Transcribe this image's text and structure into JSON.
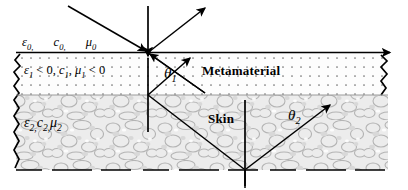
{
  "figure": {
    "type": "optics-ray-diagram",
    "width": 408,
    "height": 190
  },
  "layers": {
    "free_space": {
      "name": "free-space",
      "fill": "#ffffff",
      "params": {
        "epsilon": "ε",
        "epsilon_sub": "0,",
        "c": "c",
        "c_sub": "0,",
        "mu": "μ",
        "mu_sub": "0"
      }
    },
    "metamaterial": {
      "name": "Metamaterial",
      "fill": "#fdfdfd",
      "texture": "dotted",
      "top_y": 52,
      "bottom_y": 95,
      "params_text": "ε₁ < 0, c₁, μ₁ < 0",
      "params": {
        "epsilon": "ε",
        "epsilon_sub": "1",
        "epsilon_cond": " < 0,",
        "c": "c",
        "c_sub": "1",
        "c_sep": ",",
        "mu": "μ",
        "mu_sub": "1",
        "mu_cond": " < 0"
      }
    },
    "skin": {
      "name": "Skin",
      "fill": "#efefef",
      "texture": "mottled",
      "top_y": 95,
      "bottom_y": 170,
      "params": {
        "epsilon": "ε",
        "epsilon_sub": "2,",
        "c": "c",
        "c_sub": "2,",
        "mu": "μ",
        "mu_sub": "2"
      }
    }
  },
  "angles": {
    "theta1": {
      "symbol": "θ",
      "sub": "1"
    },
    "theta2": {
      "symbol": "θ",
      "sub": "2"
    }
  },
  "colors": {
    "ray": "#000000",
    "interface": "#000000",
    "metamaterial_fill": "#fdfdfd",
    "metamaterial_dot": "#6b6b6b",
    "skin_fill": "#e9e9e9",
    "skin_blob": "#bcbcbc",
    "text": "#000000"
  },
  "geometry": {
    "incidence_point": [
      148,
      52
    ],
    "metamaterial_exit_point": [
      148,
      95
    ],
    "skin_bottom_point": [
      245,
      170
    ],
    "interface_arrow_tip": [
      395,
      52
    ]
  }
}
